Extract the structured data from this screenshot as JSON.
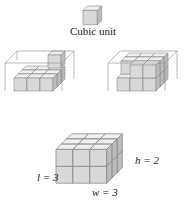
{
  "figure": {
    "unit_label": "Cubic unit",
    "dimensions": {
      "length_label": "l = 3",
      "width_label": "w = 3",
      "height_label": "h = 2"
    },
    "panels": [
      {
        "name": "unit-cube",
        "description": "single cubic unit"
      },
      {
        "name": "partial-fill-1",
        "description": "3x3 bottom layer filled, one cube on top layer, wireframe box 3x3x2"
      },
      {
        "name": "partial-fill-2",
        "description": "3x3 bottom layer filled, top layer partially filled, wireframe box 3x3x2"
      },
      {
        "name": "full-box",
        "description": "3x3x2 box completely filled with cubes"
      }
    ],
    "colors": {
      "top_face": "#f0f0f0",
      "front_face": "#d8d8d8",
      "side_face": "#b8b8b8",
      "edge": "#8a8a8a"
    }
  }
}
